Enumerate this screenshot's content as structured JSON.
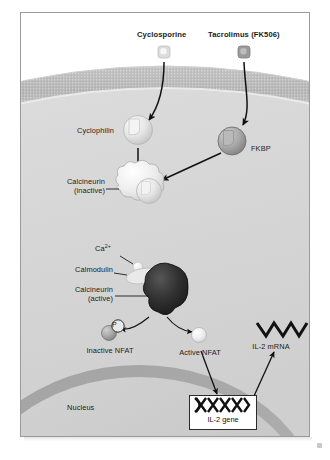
{
  "diagram": {
    "drugs": [
      {
        "name": "Cyclosporine",
        "molecule_color": "#d8d8d8"
      },
      {
        "name": "Tacrolimus (FK506)",
        "molecule_color": "#9a9a9a"
      }
    ],
    "proteins": {
      "cyclophilin": "Cyclophilin",
      "fkbp": "FKBP",
      "calcineurin_inactive_line1": "Calcineurin",
      "calcineurin_inactive_line2": "(inactive)",
      "calmodulin": "Calmodulin",
      "calcineurin_active_line1": "Calcineurin",
      "calcineurin_active_line2": "(active)",
      "calcium_ion": "Ca",
      "calcium_charge": "2+"
    },
    "nfat": {
      "inactive": "Inactive NFAT",
      "active": "Active NFAT",
      "phosphate_label": "P"
    },
    "gene": {
      "box_label": "IL-2 gene",
      "mrna_label": "IL-2 mRNA"
    },
    "compartments": {
      "nucleus": "Nucleus"
    },
    "colors": {
      "cytoplasm": "#d7d7d7",
      "membrane": "#bdbdbd",
      "nucleus_fill": "#c9c9c9",
      "nucleus_rim": "#a8a8a8",
      "arrow": "#111111",
      "frame_border": "#9a9a9a",
      "calcineurin_active": "#2e2e2e",
      "gene_box_border": "#2b2b2b"
    }
  }
}
